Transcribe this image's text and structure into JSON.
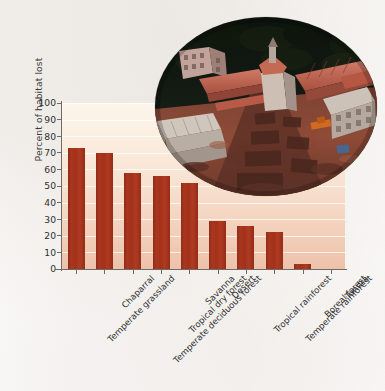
{
  "chart_data": {
    "type": "bar",
    "title": "",
    "xlabel": "",
    "ylabel": "Percent of habitat lost",
    "ylim": [
      0,
      100
    ],
    "ytick_step": 10,
    "grid": true,
    "legend": "none",
    "bar_color": "#a33219",
    "plot_background": "#f8e3d2",
    "categories": [
      "Temperate grassland",
      "Chaparral",
      "Temperate deciduous forest",
      "Tropical dry forest",
      "Savanna",
      "Desert",
      "Tropical rainforest",
      "Temperate rainforest",
      "Boreal forest",
      "Tundra"
    ],
    "values": [
      73,
      70,
      58,
      56,
      52,
      29,
      26,
      22,
      3,
      0
    ],
    "yticks": [
      "100",
      "90",
      "80",
      "70",
      "60",
      "50",
      "40",
      "30",
      "20",
      "10",
      "0"
    ],
    "ytick_values": [
      100,
      90,
      80,
      70,
      60,
      50,
      40,
      30,
      20,
      10,
      0
    ]
  },
  "figure": {
    "photo": {
      "name": "aerial-photo-of-cleared-land-development",
      "alt": "Aerial photograph of a hillside development site with red-roofed buildings and cleared red earth under construction, surrounded by dark forest",
      "colors": {
        "forest_dark": "#1a1f17",
        "roof_red": "#c1604f",
        "earth_red": "#8d4434",
        "building_white": "#d8cfc7"
      }
    }
  }
}
